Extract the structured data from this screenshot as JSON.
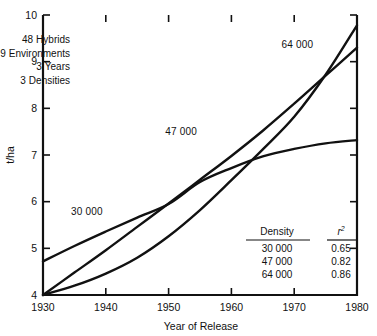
{
  "chart_data": {
    "type": "line",
    "title": "",
    "xlabel": "Year of Release",
    "ylabel": "t/ha",
    "xlim": [
      1930,
      1980
    ],
    "ylim": [
      4,
      10
    ],
    "xticks": [
      1930,
      1940,
      1950,
      1960,
      1970,
      1980
    ],
    "xticklabels": [
      "1930",
      "1940",
      "1950",
      "1960",
      "1970",
      "1980"
    ],
    "yticks": [
      4,
      5,
      6,
      7,
      8,
      9,
      10
    ],
    "yticklabels": [
      "4",
      "5",
      "6",
      "7",
      "8",
      "9",
      "10"
    ],
    "grid": false,
    "legend": "inline-curve-labels",
    "x": [
      1930,
      1935,
      1940,
      1945,
      1950,
      1955,
      1960,
      1965,
      1970,
      1975,
      1980
    ],
    "series": [
      {
        "name": "30 000",
        "label": "30 000",
        "label_x": 1937.0,
        "label_y": 5.72,
        "values": [
          4.72,
          5.05,
          5.36,
          5.66,
          5.95,
          6.42,
          6.72,
          6.97,
          7.13,
          7.25,
          7.32
        ]
      },
      {
        "name": "47 000",
        "label": "47 000",
        "label_x": 1952.0,
        "label_y": 7.42,
        "values": [
          4.0,
          4.48,
          4.96,
          5.46,
          5.96,
          6.47,
          6.98,
          7.52,
          8.1,
          8.7,
          9.3
        ]
      },
      {
        "name": "64 000",
        "label": "64 000",
        "label_x": 1970.5,
        "label_y": 9.3,
        "values": [
          4.0,
          4.2,
          4.46,
          4.8,
          5.26,
          5.82,
          6.46,
          7.12,
          7.82,
          8.72,
          9.78
        ]
      }
    ],
    "annotations": {
      "study_notes": [
        "48 Hybrids",
        "9 Environments",
        "3 Years",
        "3 Densities"
      ],
      "stats_table": {
        "headers": [
          "Density",
          "r²"
        ],
        "header_r": "r",
        "header_r_sup": "2",
        "rows": [
          {
            "density": "30 000",
            "r2": "0.65"
          },
          {
            "density": "47 000",
            "r2": "0.82"
          },
          {
            "density": "64 000",
            "r2": "0.86"
          }
        ]
      }
    }
  }
}
